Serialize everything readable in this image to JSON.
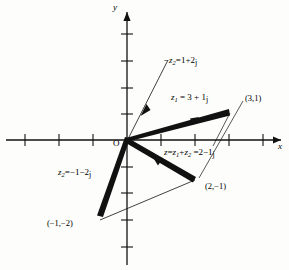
{
  "figure": {
    "type": "complex-plane-vector-diagram",
    "axes": {
      "x_axis_label": "x",
      "y_axis_label": "y",
      "origin_label": "O",
      "x_ticks": [
        -4,
        -3,
        -2,
        -1,
        1,
        2,
        3,
        4
      ],
      "y_ticks": [
        -4,
        -3,
        -2,
        -1,
        1,
        2,
        3,
        4
      ],
      "x_range": [
        -4.4,
        4.6
      ],
      "y_range": [
        -4.6,
        4.6
      ]
    },
    "labels": {
      "neg_z2": {
        "lhs": "−z",
        "sub": "2",
        "eq": "=",
        "rhs": "1+2",
        "unit": "j"
      },
      "z1": {
        "lhs": "z",
        "sub": "1",
        "eq": "=",
        "rhs": "3 + 1",
        "unit": "j"
      },
      "sum": {
        "lhs": "z",
        "eq1": "=",
        "t1": "z",
        "t1sub": "1",
        "plus": "+",
        "t2": "z",
        "t2sub": "2",
        "eq2": "=",
        "rhs": "2−1",
        "unit": "j"
      },
      "z2": {
        "lhs": "z",
        "sub": "2",
        "eq": "=",
        "rhs": "−1−2",
        "unit": "j"
      },
      "point_z1": "(3,1)",
      "point_sum": "(2,−1)",
      "point_z2": "(−1,−2)"
    },
    "vectors": [
      {
        "name": "z1",
        "from": [
          0,
          0
        ],
        "to": [
          3,
          1
        ],
        "style": "thick",
        "label": "z1"
      },
      {
        "name": "z2",
        "from": [
          0,
          0
        ],
        "to": [
          -1,
          -2
        ],
        "style": "thick",
        "label": "z2"
      },
      {
        "name": "sum",
        "from": [
          0,
          0
        ],
        "to": [
          2,
          -1
        ],
        "style": "thick",
        "label": "sum"
      },
      {
        "name": "neg-z2",
        "from": [
          0,
          0
        ],
        "to": [
          1,
          2
        ],
        "style": "thin-arrow",
        "label": "neg_z2"
      }
    ],
    "construction_lines": [
      {
        "name": "parallelogram-side",
        "from": [
          -1,
          -2
        ],
        "to": [
          2,
          -1
        ]
      }
    ],
    "colors": {
      "ink": "#000000",
      "background": "#fdfdfb"
    }
  }
}
